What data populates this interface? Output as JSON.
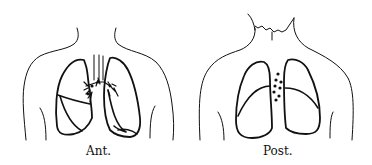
{
  "figure": {
    "panels": [
      {
        "id": "anterior",
        "label": "Ant.",
        "view": "anterior torso with lungs and hilar bronchial markings"
      },
      {
        "id": "posterior",
        "label": "Post.",
        "view": "posterior torso with lungs and dots between lungs"
      }
    ],
    "colors": {
      "line": "#111111",
      "background": "#ffffff"
    }
  }
}
